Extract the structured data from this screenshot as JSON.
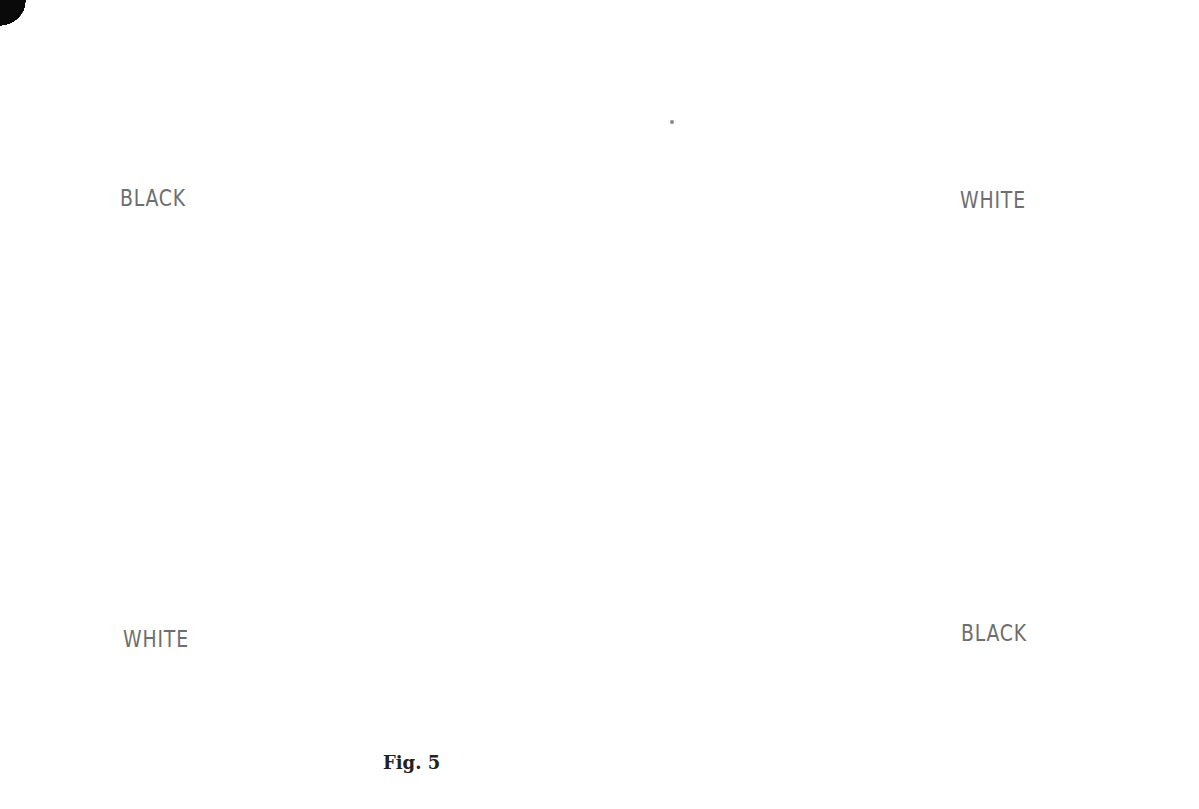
{
  "figure": {
    "caption": "Fig. 5",
    "game": "Hex",
    "board_size": 11
  },
  "board": {
    "geometry": {
      "top": [
        575,
        76
      ],
      "step_letter": [
        56.3,
        33.5
      ],
      "step_number_down": [
        -56.3,
        33.5
      ],
      "stone_radius": 23
    },
    "letters": [
      "A",
      "B",
      "C",
      "D",
      "E",
      "F",
      "G",
      "H",
      "I",
      "K",
      "L"
    ],
    "numbers": [
      1,
      2,
      3,
      4,
      5,
      6,
      7,
      8,
      9,
      10,
      11
    ],
    "top_right_edge_labels": [
      "A",
      "B",
      "C",
      "D",
      "E",
      "F",
      "G",
      "H",
      "I",
      "K",
      "L"
    ],
    "top_left_edge_labels": [
      "11",
      "10",
      "9",
      "8",
      "7",
      "6",
      "5",
      "4",
      "3",
      "2"
    ],
    "bottom_right_edge_labels": [
      "3",
      "4",
      "5",
      "6",
      "7",
      "8",
      "9",
      "10",
      "11"
    ],
    "bottom_left_edge_labels": [
      "B",
      "C",
      "D",
      "E",
      "F",
      "G"
    ]
  },
  "side_labels": {
    "top_left": "BLACK",
    "top_right": "WHITE",
    "bottom_left": "WHITE",
    "bottom_right": "BLACK"
  },
  "stones": [
    {
      "cell": "B10",
      "color": "black",
      "move": "45"
    },
    {
      "cell": "C10",
      "color": "black",
      "move": ""
    },
    {
      "cell": "D10",
      "color": "black",
      "move": ""
    },
    {
      "cell": "E10",
      "color": "black",
      "move": ""
    },
    {
      "cell": "F10",
      "color": "black",
      "move": ""
    },
    {
      "cell": "G10",
      "color": "black",
      "move": ""
    },
    {
      "cell": "B9",
      "color": "white",
      "move": "44"
    },
    {
      "cell": "C9",
      "color": "white",
      "move": "46"
    },
    {
      "cell": "B8",
      "color": "white",
      "move": ""
    },
    {
      "cell": "B7",
      "color": "black",
      "move": ""
    },
    {
      "cell": "C8",
      "color": "black",
      "move": "43"
    },
    {
      "cell": "D9",
      "color": "white",
      "move": ""
    },
    {
      "cell": "E9",
      "color": "white",
      "move": ""
    },
    {
      "cell": "C7",
      "color": "white",
      "move": "42"
    },
    {
      "cell": "D8",
      "color": "white",
      "move": ""
    },
    {
      "cell": "E8",
      "color": "black",
      "move": ""
    },
    {
      "cell": "F9",
      "color": "white",
      "move": ""
    },
    {
      "cell": "C6",
      "color": "white",
      "move": "48"
    },
    {
      "cell": "D7",
      "color": "black",
      "move": "41"
    },
    {
      "cell": "C5",
      "color": "white",
      "move": ""
    },
    {
      "cell": "D6",
      "color": "white",
      "move": ""
    },
    {
      "cell": "G9",
      "color": "white",
      "move": ""
    },
    {
      "cell": "D5",
      "color": "black",
      "move": ""
    },
    {
      "cell": "E6",
      "color": "black",
      "move": ""
    },
    {
      "cell": "G8",
      "color": "black",
      "move": "61"
    },
    {
      "cell": "H9",
      "color": "black",
      "move": ""
    },
    {
      "cell": "C4",
      "color": "white",
      "move": "64"
    },
    {
      "cell": "G7",
      "color": "black",
      "move": ""
    },
    {
      "cell": "H8",
      "color": "white",
      "move": "62"
    },
    {
      "cell": "I9",
      "color": "white",
      "move": ""
    },
    {
      "cell": "I8",
      "color": "black",
      "move": "57"
    },
    {
      "cell": "H7",
      "color": "white",
      "move": ""
    },
    {
      "cell": "I7",
      "color": "black",
      "move": "59"
    },
    {
      "cell": "K8",
      "color": "white",
      "move": "58"
    },
    {
      "cell": "I6",
      "color": "white",
      "move": "60"
    },
    {
      "cell": "K7",
      "color": "white",
      "move": ""
    },
    {
      "cell": "K6",
      "color": "white",
      "move": ""
    },
    {
      "cell": "H11",
      "color": "black",
      "move": "51"
    },
    {
      "cell": "I11",
      "color": "black",
      "move": "55"
    },
    {
      "cell": "I10",
      "color": "black",
      "move": "53"
    },
    {
      "cell": "K11",
      "color": "white",
      "move": "56"
    },
    {
      "cell": "K10",
      "color": "white",
      "move": "52"
    },
    {
      "cell": "K9",
      "color": "white",
      "move": "54"
    },
    {
      "cell": "C3",
      "color": "black",
      "move": "65"
    },
    {
      "cell": "D4",
      "color": "black",
      "move": "63"
    },
    {
      "cell": "E5",
      "color": "black",
      "move": "47"
    },
    {
      "cell": "D3",
      "color": "white",
      "move": ""
    },
    {
      "cell": "E4",
      "color": "white",
      "move": ""
    },
    {
      "cell": "F5",
      "color": "white",
      "move": ""
    },
    {
      "cell": "C2",
      "color": "white",
      "move": "50"
    },
    {
      "cell": "D2",
      "color": "white",
      "move": "66"
    },
    {
      "cell": "C1",
      "color": "white",
      "move": "68"
    },
    {
      "cell": "D1",
      "color": "black",
      "move": "67"
    },
    {
      "cell": "E1",
      "color": "black",
      "move": "49"
    },
    {
      "cell": "H5",
      "color": "black",
      "move": ""
    },
    {
      "cell": "G3",
      "color": "black",
      "move": ""
    },
    {
      "cell": "G2",
      "color": "black",
      "move": ""
    },
    {
      "cell": "H3",
      "color": "black",
      "move": ""
    },
    {
      "cell": "I3",
      "color": "black",
      "move": ""
    },
    {
      "cell": "H2",
      "color": "white",
      "move": ""
    },
    {
      "cell": "K4",
      "color": "white",
      "move": ""
    },
    {
      "cell": "H1",
      "color": "black",
      "move": ""
    },
    {
      "cell": "I2",
      "color": "white",
      "move": ""
    },
    {
      "cell": "I1",
      "color": "black",
      "move": ""
    },
    {
      "cell": "K2",
      "color": "white",
      "move": ""
    },
    {
      "cell": "K1",
      "color": "black",
      "move": ""
    },
    {
      "cell": "L2",
      "color": "white",
      "move": ""
    },
    {
      "cell": "L1",
      "color": "black",
      "move": ""
    }
  ]
}
